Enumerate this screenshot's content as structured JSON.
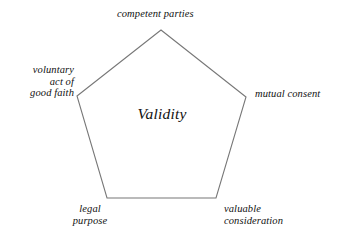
{
  "diagram": {
    "type": "pentagon-concept-diagram",
    "center": {
      "label": "Validity"
    },
    "stroke_color": "#777777",
    "fill_color": "#ffffff",
    "background_color": "#ffffff",
    "text_color": "#111111",
    "vertices": [
      {
        "id": "top",
        "x": 161,
        "y": 30
      },
      {
        "id": "right",
        "x": 246,
        "y": 97
      },
      {
        "id": "bottom-right",
        "x": 216,
        "y": 198
      },
      {
        "id": "bottom-left",
        "x": 107,
        "y": 198
      },
      {
        "id": "left",
        "x": 77,
        "y": 96
      }
    ],
    "nodes": {
      "top": {
        "label": "competent parties",
        "lines": [
          "competent parties"
        ]
      },
      "left": {
        "label": "voluntary act of good faith",
        "line1": "voluntary",
        "line2": "act of",
        "line3": "good faith"
      },
      "right": {
        "label": "mutual consent",
        "lines": [
          "mutual consent"
        ]
      },
      "bottom_left": {
        "label": "legal purpose",
        "line1": "legal",
        "line2": "purpose"
      },
      "bottom_right": {
        "label": "valuable consideration",
        "line1": "valuable",
        "line2": "consideration"
      }
    }
  }
}
